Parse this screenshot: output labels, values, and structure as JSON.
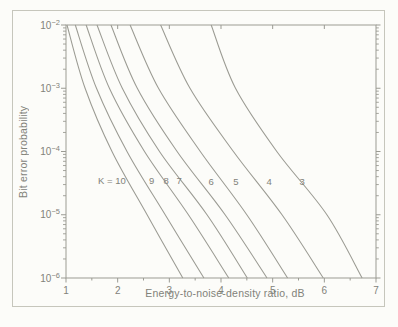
{
  "figure": {
    "background": "#fcfcf9",
    "border_color": "#c6c6bc",
    "line_color": "#9b9b93",
    "text_color": "#82827a"
  },
  "chart_data": {
    "type": "line",
    "title": "",
    "xlabel": "Energy-to-noise-density ratio, dB",
    "ylabel": "Bit error probability",
    "x_axis": {
      "min": 1,
      "max": 7,
      "major_ticks": [
        1,
        2,
        3,
        4,
        5,
        6,
        7
      ],
      "minor_ticks": [
        1.5,
        2.5,
        3.5,
        4.5,
        5.5,
        6.5
      ],
      "top_ticks": [
        2,
        3,
        4,
        5,
        6
      ]
    },
    "y_axis": {
      "scale": "log",
      "min": 1e-06,
      "max": 0.01,
      "decade_exponents": [
        -2,
        -3,
        -4,
        -5,
        -6
      ],
      "minor_decades": [
        -3,
        -4,
        -5,
        -6
      ]
    },
    "grid": false,
    "legend": "inline curve labels",
    "series": [
      {
        "name": "K=10",
        "constraint_length": 10,
        "db_at_decades": [
          1.02,
          1.37,
          1.89,
          2.57,
          3.26
        ]
      },
      {
        "name": "K=9",
        "constraint_length": 9,
        "db_at_decades": [
          1.18,
          1.59,
          2.18,
          2.92,
          3.67
        ]
      },
      {
        "name": "K=8",
        "constraint_length": 8,
        "db_at_decades": [
          1.39,
          1.84,
          2.52,
          3.37,
          4.15
        ]
      },
      {
        "name": "K=7",
        "constraint_length": 7,
        "db_at_decades": [
          1.6,
          2.09,
          2.81,
          3.73,
          4.51
        ]
      },
      {
        "name": "K=6",
        "constraint_length": 6,
        "db_at_decades": [
          1.87,
          2.38,
          3.15,
          4.08,
          4.89
        ]
      },
      {
        "name": "K=5",
        "constraint_length": 5,
        "db_at_decades": [
          2.24,
          2.79,
          3.6,
          4.5,
          5.29
        ]
      },
      {
        "name": "K=4",
        "constraint_length": 4,
        "db_at_decades": [
          2.83,
          3.4,
          4.24,
          5.18,
          5.98
        ]
      },
      {
        "name": "K=3",
        "constraint_length": 3,
        "db_at_decades": [
          3.81,
          4.28,
          5.08,
          6.05,
          6.73
        ]
      }
    ],
    "decade_probabilities_note": "db_at_decades gives Eb/N0 in dB where each curve crosses P = 1e-2, 1e-3, 1e-4, 1e-5, 1e-6",
    "curve_labels": [
      {
        "text": "K = 10",
        "db": 1.89,
        "exp": -4.47
      },
      {
        "text": "9",
        "db": 2.66,
        "exp": -4.47
      },
      {
        "text": "8",
        "db": 2.94,
        "exp": -4.47
      },
      {
        "text": "7",
        "db": 3.19,
        "exp": -4.47
      },
      {
        "text": "6",
        "db": 3.81,
        "exp": -4.48
      },
      {
        "text": "5",
        "db": 4.29,
        "exp": -4.48
      },
      {
        "text": "4",
        "db": 4.93,
        "exp": -4.48
      },
      {
        "text": "3",
        "db": 5.57,
        "exp": -4.48
      }
    ]
  }
}
